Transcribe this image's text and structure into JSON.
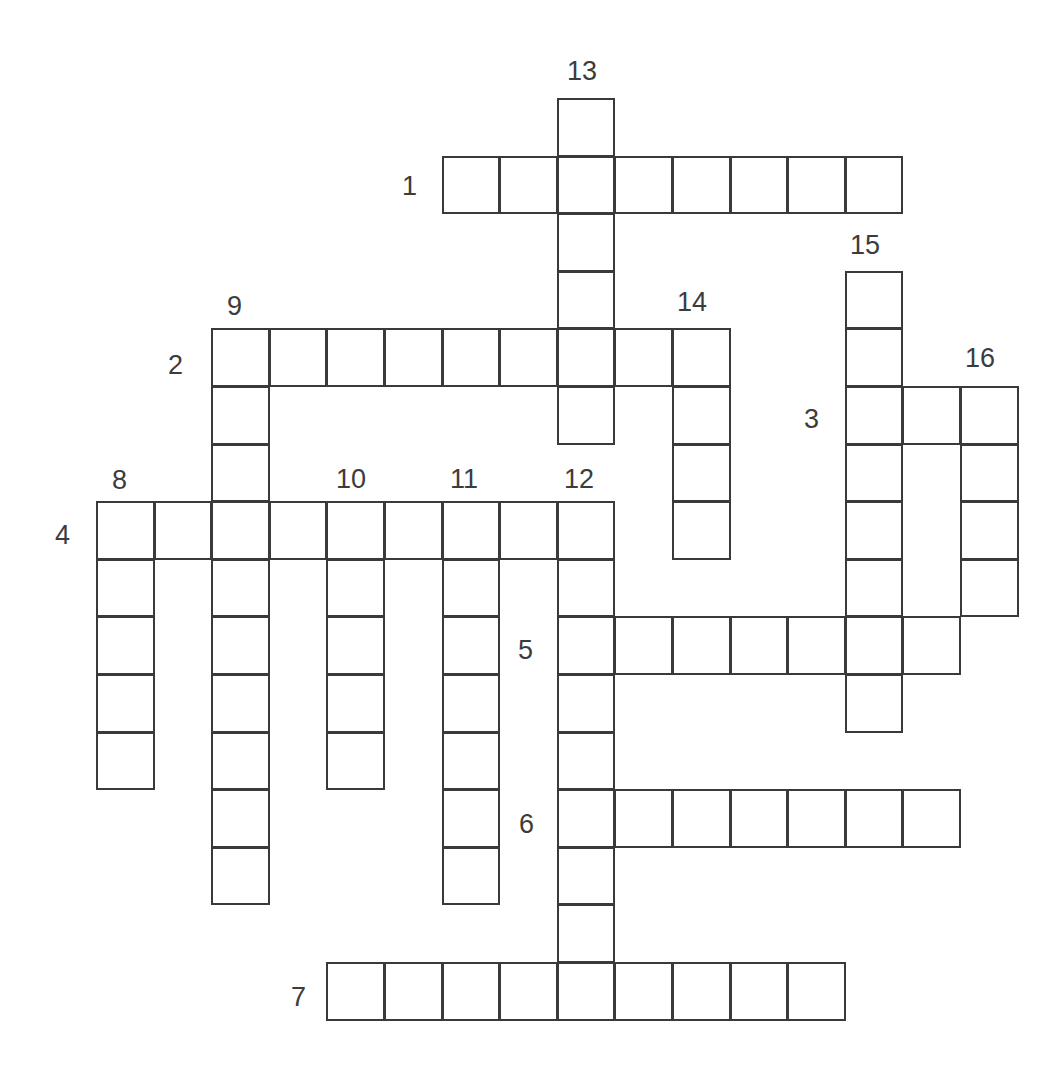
{
  "puzzle": {
    "type": "crossword",
    "grid": {
      "origin_x": 97,
      "origin_y": 99,
      "cell_size": 57.6,
      "line_color": "#3a3a3a",
      "number_color": "#3c3c3c"
    },
    "across": [
      {
        "number": "1",
        "row": 1,
        "col": 6,
        "length": 8,
        "label_x": 402,
        "label_y": 173
      },
      {
        "number": "2",
        "row": 4,
        "col": 2,
        "length": 9,
        "label_x": 168,
        "label_y": 352
      },
      {
        "number": "3",
        "row": 5,
        "col": 13,
        "length": 3,
        "label_x": 804,
        "label_y": 406
      },
      {
        "number": "4",
        "row": 7,
        "col": 0,
        "length": 9,
        "label_x": 55,
        "label_y": 522
      },
      {
        "number": "5",
        "row": 9,
        "col": 8,
        "length": 7,
        "label_x": 518,
        "label_y": 637
      },
      {
        "number": "6",
        "row": 12,
        "col": 8,
        "length": 7,
        "label_x": 519,
        "label_y": 811
      },
      {
        "number": "7",
        "row": 15,
        "col": 4,
        "length": 9,
        "label_x": 291,
        "label_y": 984
      }
    ],
    "down": [
      {
        "number": "8",
        "row": 7,
        "col": 0,
        "length": 5,
        "label_x": 112,
        "label_y": 467
      },
      {
        "number": "9",
        "row": 4,
        "col": 2,
        "length": 10,
        "label_x": 227,
        "label_y": 293
      },
      {
        "number": "10",
        "row": 7,
        "col": 4,
        "length": 5,
        "label_x": 336,
        "label_y": 466
      },
      {
        "number": "11",
        "row": 7,
        "col": 6,
        "length": 7,
        "label_x": 450,
        "label_y": 466
      },
      {
        "number": "12",
        "row": 7,
        "col": 8,
        "length": 9,
        "label_x": 564,
        "label_y": 466
      },
      {
        "number": "13",
        "row": 0,
        "col": 8,
        "length": 6,
        "label_x": 567,
        "label_y": 58
      },
      {
        "number": "14",
        "row": 4,
        "col": 10,
        "length": 4,
        "label_x": 677,
        "label_y": 289
      },
      {
        "number": "15",
        "row": 3,
        "col": 13,
        "length": 8,
        "label_x": 850,
        "label_y": 232
      },
      {
        "number": "16",
        "row": 5,
        "col": 15,
        "length": 4,
        "label_x": 965,
        "label_y": 345
      }
    ]
  }
}
